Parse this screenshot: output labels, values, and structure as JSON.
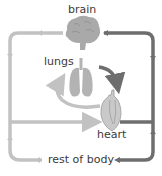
{
  "diagram": {
    "colors": {
      "oxygenated": "#6e6e6e",
      "deoxygenated": "#c2c2c2",
      "organ": "#a9a9a9",
      "text": "#3a3a3a"
    },
    "labels": {
      "brain": "brain",
      "lungs": "lungs",
      "heart": "heart",
      "body": "rest of body"
    },
    "nodes": [
      {
        "id": "brain",
        "label": "brain",
        "icon": "brain-icon"
      },
      {
        "id": "lungs",
        "label": "lungs",
        "icon": "lungs-icon"
      },
      {
        "id": "heart",
        "label": "heart",
        "icon": "heart-icon"
      },
      {
        "id": "body",
        "label": "rest of body",
        "icon": null
      }
    ],
    "edges": [
      {
        "from": "heart",
        "to": "brain",
        "style": "dark"
      },
      {
        "from": "heart",
        "to": "body",
        "style": "dark"
      },
      {
        "from": "brain",
        "to": "heart",
        "style": "light"
      },
      {
        "from": "body",
        "to": "heart",
        "style": "light"
      },
      {
        "from": "heart",
        "to": "lungs",
        "style": "light"
      },
      {
        "from": "lungs",
        "to": "heart",
        "style": "dark"
      }
    ]
  }
}
